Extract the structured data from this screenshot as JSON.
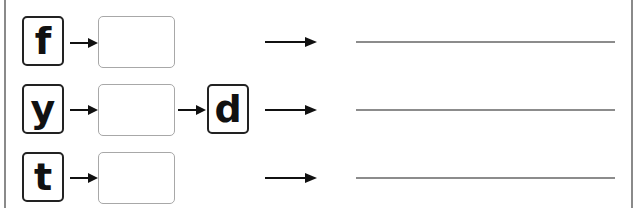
{
  "worksheet": {
    "rows": [
      {
        "start_letter": "f",
        "middle_letter": "",
        "end_letter": "",
        "answer": ""
      },
      {
        "start_letter": "y",
        "middle_letter": "",
        "end_letter": "d",
        "answer": ""
      },
      {
        "start_letter": "t",
        "middle_letter": "",
        "end_letter": "",
        "answer": ""
      }
    ],
    "colors": {
      "box_border": "#222222",
      "empty_box_border": "#a8a8a8",
      "line": "#8c8c8c",
      "frame": "#8a8a8a"
    }
  }
}
